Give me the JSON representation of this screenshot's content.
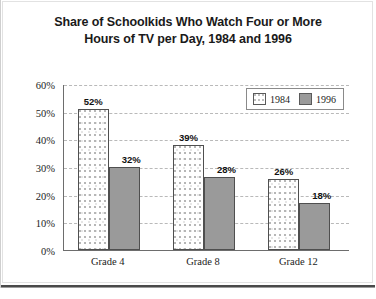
{
  "chart_data": {
    "type": "bar",
    "title": "Share of Schoolkids Who Watch Four or More Hours of TV per Day, 1984 and 1996",
    "title_line1": "Share of Schoolkids Who Watch Four or More",
    "title_line2": "Hours of TV per Day, 1984 and 1996",
    "xlabel": "",
    "ylabel": "Percent of Each Grade",
    "categories": [
      "Grade 4",
      "Grade 8",
      "Grade 12"
    ],
    "series": [
      {
        "name": "1984",
        "values": [
          52,
          39,
          26
        ],
        "labels": [
          "52%",
          "39%",
          "26%"
        ],
        "drawn_values": [
          51,
          38,
          25.5
        ],
        "color": "#ffffff",
        "pattern": "stipple-dots",
        "border_color": "#4f4f4f"
      },
      {
        "name": "1996",
        "values": [
          32,
          28,
          18
        ],
        "labels": [
          "32%",
          "28%",
          "18%"
        ],
        "drawn_values": [
          30,
          26.5,
          17
        ],
        "color": "#9a9a9a",
        "pattern": "solid",
        "border_color": "#4f4f4f"
      }
    ],
    "ylim": [
      0,
      60
    ],
    "ytick_step": 10,
    "ytick_labels": [
      "0%",
      "10%",
      "20%",
      "30%",
      "40%",
      "50%",
      "60%"
    ],
    "ytick_values": [
      0,
      10,
      20,
      30,
      40,
      50,
      60
    ],
    "grid": true,
    "grid_style": "dashed",
    "grid_color": "#b9b9b9",
    "legend": {
      "position": "top-right",
      "entries": [
        "1984",
        "1996"
      ]
    },
    "axis_color": "#6d6d6d",
    "background": "#ffffff"
  }
}
